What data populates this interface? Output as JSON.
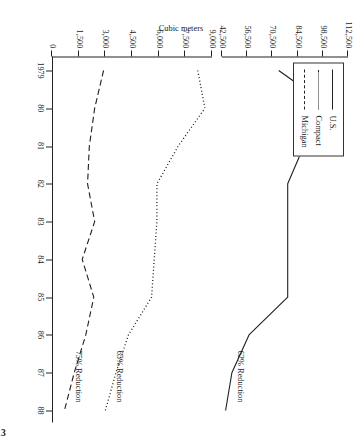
{
  "figure": {
    "caption": "FIGURE 10-13",
    "axis_title": "Cubic meters"
  },
  "legend": {
    "items": [
      {
        "label": "U.S.",
        "style": "solid"
      },
      {
        "label": "Compact",
        "style": "dotted"
      },
      {
        "label": "Michigan",
        "style": "dashed"
      }
    ]
  },
  "annotations": [
    {
      "text": "62% Reduction",
      "series": "U.S."
    },
    {
      "text": "65% Reduction",
      "series": "Compact"
    },
    {
      "text": "75% Reduction",
      "series": "Michigan"
    }
  ],
  "axes": {
    "x_ticks": [
      "1979",
      "80",
      "81",
      "82",
      "83",
      "84",
      "85",
      "86",
      "87",
      "88"
    ],
    "y_upper_ticks": [
      "112,500",
      "98,500",
      "84,500",
      "70,500",
      "56,500",
      "42,500"
    ],
    "y_lower_ticks": [
      "9,000",
      "7,500",
      "6,000",
      "4,500",
      "3,000",
      "1,500",
      "0"
    ],
    "broken_axis": true
  },
  "chart_data": {
    "type": "line",
    "title": "",
    "subtitle": "",
    "xlabel": "",
    "ylabel": "Cubic meters",
    "grid": false,
    "legend_position": "top-left",
    "broken_axis": true,
    "x": [
      1979,
      1980,
      1981,
      1982,
      1983,
      1984,
      1985,
      1986,
      1987,
      1988
    ],
    "x_tick_labels": [
      "1979",
      "80",
      "81",
      "82",
      "83",
      "84",
      "85",
      "86",
      "87",
      "88"
    ],
    "upper_scale": {
      "ticks": [
        112500,
        98500,
        84500,
        70500,
        56500,
        42500
      ],
      "ylim": [
        42500,
        112500
      ],
      "tick_labels": [
        "112,500",
        "98,500",
        "84,500",
        "70,500",
        "56,500",
        "42,500"
      ]
    },
    "lower_scale": {
      "ticks": [
        9000,
        7500,
        6000,
        4500,
        3000,
        1500,
        0
      ],
      "ylim": [
        0,
        9000
      ],
      "tick_labels": [
        "9,000",
        "7,500",
        "6,000",
        "4,500",
        "3,000",
        "1,500",
        "0"
      ]
    },
    "series": [
      {
        "name": "U.S.",
        "style": "solid",
        "scale": "upper",
        "annotation": "62% Reduction",
        "values": [
          74000,
          103500,
          88000,
          79000,
          79000,
          79000,
          79000,
          57500,
          48000,
          44500
        ]
      },
      {
        "name": "Compact",
        "style": "dotted",
        "scale": "lower",
        "annotation": "65% Reduction",
        "values": [
          8200,
          8600,
          7100,
          5900,
          5900,
          5750,
          5600,
          4300,
          3600,
          3000
        ]
      },
      {
        "name": "Michigan",
        "style": "dashed",
        "scale": "lower",
        "annotation": "75% Reduction",
        "values": [
          2900,
          2400,
          2100,
          2000,
          2400,
          1700,
          2350,
          1900,
          1250,
          700
        ]
      }
    ]
  }
}
